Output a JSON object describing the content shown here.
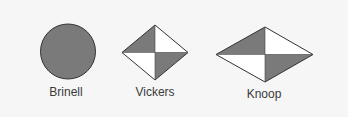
{
  "colors": {
    "background": "#f6f6f6",
    "fill_dark": "#7a7a7a",
    "fill_light": "#ffffff",
    "stroke": "#333333",
    "text": "#3a3a3a"
  },
  "indenters": [
    {
      "name": "Brinell",
      "shape": "circle"
    },
    {
      "name": "Vickers",
      "shape": "square-diamond"
    },
    {
      "name": "Knoop",
      "shape": "elongated-rhombus"
    }
  ]
}
